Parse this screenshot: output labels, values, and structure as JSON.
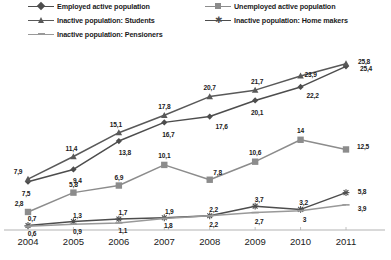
{
  "chart_data": {
    "type": "line",
    "title": "",
    "xlabel": "",
    "ylabel": "",
    "categories": [
      "2004",
      "2005",
      "2006",
      "2007",
      "2008",
      "2009",
      "2010",
      "2011"
    ],
    "ylim": [
      0,
      27
    ],
    "grid": false,
    "legend_position": "top",
    "decimal_separator": ",",
    "series": [
      {
        "name": "Employed active population",
        "color": "#4d4d4d",
        "marker": "diamond",
        "values": [
          7.5,
          9.4,
          13.8,
          16.7,
          17.6,
          20.1,
          22.2,
          25.4
        ],
        "labels": [
          "7,5",
          "9,4",
          "13,8",
          "16,7",
          "17,6",
          "20,1",
          "22,2",
          "25,4"
        ]
      },
      {
        "name": "Unemployed active population",
        "color": "#8c8c8c",
        "marker": "square",
        "values": [
          2.8,
          5.8,
          6.9,
          10.1,
          7.8,
          10.6,
          14.0,
          12.5
        ],
        "labels": [
          "2,8",
          "5,8",
          "6,9",
          "10,1",
          "7,8",
          "10,6",
          "14",
          "12,5"
        ]
      },
      {
        "name": "Inactive population: Students",
        "color": "#595959",
        "marker": "triangle",
        "values": [
          7.9,
          11.4,
          15.1,
          17.8,
          20.7,
          21.7,
          23.9,
          25.8
        ],
        "labels": [
          "7,9",
          "11,4",
          "15,1",
          "17,8",
          "20,7",
          "21,7",
          "23,9",
          "25,8"
        ]
      },
      {
        "name": "Inactive population: Home makers",
        "color": "#4d4d4d",
        "marker": "cross",
        "values": [
          0.7,
          1.3,
          1.7,
          1.9,
          2.2,
          3.7,
          3.2,
          5.8
        ],
        "labels": [
          "0,7",
          "1,3",
          "1,7",
          "1,9",
          "2,2",
          "3,7",
          "3,2",
          "5,8"
        ]
      },
      {
        "name": "Inactive population: Pensioners",
        "color": "#999999",
        "marker": "dash",
        "values": [
          0.6,
          0.9,
          1.1,
          1.8,
          2.2,
          2.7,
          3.0,
          3.9
        ],
        "labels": [
          "0,6",
          "0,9",
          "1,1",
          "1,8",
          "2,2",
          "2,7",
          "3",
          "3,9"
        ]
      }
    ],
    "legend": [
      {
        "label": "Employed active population",
        "marker": "diamond",
        "color": "#4d4d4d"
      },
      {
        "label": "Unemployed active population",
        "marker": "square",
        "color": "#8c8c8c"
      },
      {
        "label": "Inactive population: Students",
        "marker": "triangle",
        "color": "#595959"
      },
      {
        "label": "Inactive population: Home makers",
        "marker": "cross",
        "color": "#4d4d4d"
      },
      {
        "label": "Inactive population: Pensioners",
        "marker": "dash",
        "color": "#999999"
      }
    ],
    "axis_color": "#b3b3b3"
  }
}
